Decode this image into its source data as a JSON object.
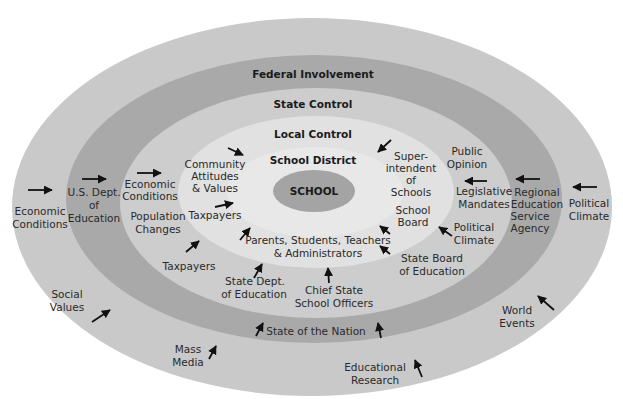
{
  "colors": {
    "background": "#ffffff",
    "outer_ring": "#c9c9c9",
    "federal_ring": "#a9a9a9",
    "state_ring": "#cdcdcd",
    "local_ring": "#e1e1e1",
    "district_ring": "#e8e8e8",
    "school_core": "#a4a4a4",
    "text": "#2a2a2a",
    "arrow": "#111111"
  },
  "rings": {
    "federal": "Federal Involvement",
    "state": "State Control",
    "local": "Local Control",
    "district": "School District",
    "core": "SCHOOL"
  },
  "labels": {
    "outer": {
      "economic_conditions": [
        "Economic",
        "Conditions"
      ],
      "political_climate": [
        "Political",
        "Climate"
      ],
      "social_values": [
        "Social",
        "Values"
      ],
      "world_events": [
        "World",
        "Events"
      ],
      "mass_media": [
        "Mass",
        "Media"
      ],
      "educational_research": [
        "Educational",
        "Research"
      ]
    },
    "federal": {
      "us_dept_education": [
        "U.S. Dept.",
        "of",
        "Education"
      ],
      "regional_agency": [
        "Regional",
        "Education",
        "Service",
        "Agency"
      ],
      "state_of_nation": [
        "State of the Nation"
      ]
    },
    "state": {
      "economic_conditions": [
        "Economic",
        "Conditions"
      ],
      "population_changes": [
        "Population",
        "Changes"
      ],
      "taxpayers": [
        "Taxpayers"
      ],
      "state_dept_education": [
        "State Dept.",
        "of Education"
      ],
      "chief_state_officers": [
        "Chief State",
        "School Officers"
      ],
      "state_board_education": [
        "State Board",
        "of Education"
      ],
      "political_climate": [
        "Political",
        "Climate"
      ],
      "legislative_mandates": [
        "Legislative",
        "Mandates"
      ],
      "public_opinion": [
        "Public",
        "Opinion"
      ]
    },
    "local": {
      "community_attitudes": [
        "Community",
        "Attitudes",
        "& Values"
      ],
      "taxpayers": [
        "Taxpayers"
      ],
      "superintendent": [
        "Super-",
        "intendent",
        "of",
        "Schools"
      ],
      "school_board": [
        "School",
        "Board"
      ],
      "stakeholders": [
        "Parents, Students, Teachers",
        "& Administrators"
      ]
    }
  }
}
